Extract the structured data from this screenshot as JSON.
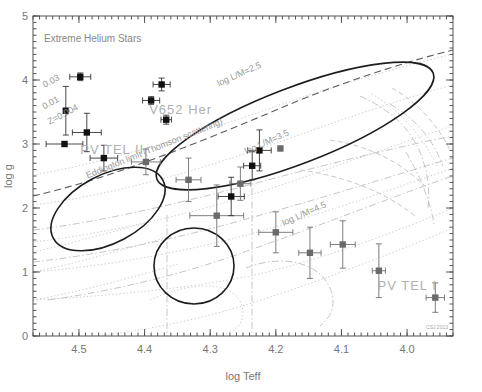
{
  "figure": {
    "title": "Extreme Helium Stars",
    "credit": "CSJ 2013"
  },
  "axes": {
    "x": {
      "label": "log Teff",
      "ticks": [
        "4.5",
        "4.4",
        "4.3",
        "4.2",
        "4.1",
        "4.0"
      ],
      "tick_values": [
        4.5,
        4.4,
        4.3,
        4.2,
        4.1,
        4.0
      ],
      "range": [
        4.57,
        3.93
      ],
      "minor_per_major": 10
    },
    "y": {
      "label": "log g",
      "ticks": [
        "0",
        "1",
        "2",
        "3",
        "4",
        "5"
      ],
      "tick_values": [
        0,
        1,
        2,
        3,
        4,
        5
      ],
      "range": [
        0,
        5
      ],
      "inverted": true,
      "minor_per_major": 10
    }
  },
  "annotations": [
    {
      "name": "eddington-limit-label",
      "text": "Eddington limit (Thomson scattering)",
      "x": 4.487,
      "y": 2.46,
      "rotation": -22,
      "style": "annot"
    },
    {
      "name": "pv-tel-i-label",
      "text": "PV TEL I",
      "x": 4.045,
      "y": 0.72,
      "rotation": 0,
      "style": "annot-big"
    },
    {
      "name": "pv-tel-ii-label",
      "text": "PV TEL II",
      "x": 4.498,
      "y": 2.85,
      "rotation": 0,
      "style": "annot-big"
    },
    {
      "name": "v652-her-label",
      "text": "V652 Her",
      "x": 4.393,
      "y": 3.47,
      "rotation": 0,
      "style": "annot-big"
    },
    {
      "name": "log-lm-45-label",
      "text": "log L/M=4.5",
      "x": 4.188,
      "y": 1.72,
      "rotation": -24,
      "style": "annot"
    },
    {
      "name": "log-lm-35-label",
      "text": "log L/M=3.5",
      "x": 4.245,
      "y": 2.84,
      "rotation": -24,
      "style": "annot"
    },
    {
      "name": "log-lm-25-label",
      "text": "log L/M=2.5",
      "x": 4.287,
      "y": 3.9,
      "rotation": -24,
      "style": "annot"
    },
    {
      "name": "metallicity-z0004-label",
      "text": "Z=0.004",
      "x": 4.545,
      "y": 3.3,
      "rotation": -28,
      "style": "annot"
    },
    {
      "name": "metallicity-001-label",
      "text": "0.01",
      "x": 4.553,
      "y": 3.54,
      "rotation": -28,
      "style": "annot"
    },
    {
      "name": "metallicity-003-label",
      "text": "0.03",
      "x": 4.552,
      "y": 3.88,
      "rotation": -28,
      "style": "annot"
    }
  ],
  "chart_data": {
    "type": "scatter",
    "title": "Extreme Helium Stars",
    "xlabel": "log Teff",
    "ylabel": "log g",
    "xlim": [
      4.57,
      3.93
    ],
    "ylim": [
      5,
      0
    ],
    "x_inverted": true,
    "y_inverted": true,
    "grid": false,
    "legend": "none",
    "points": [
      {
        "x": 4.488,
        "y": 3.18,
        "xerr": 0.022,
        "yerr": 0.3,
        "marker": "square",
        "shade": "dark"
      },
      {
        "x": 4.462,
        "y": 2.78,
        "xerr": 0.021,
        "yerr": 0.2,
        "marker": "square",
        "shade": "dark"
      },
      {
        "x": 4.522,
        "y": 3.0,
        "xerr": 0.028,
        "yerr": 0.0,
        "marker": "square",
        "shade": "dark"
      },
      {
        "x": 4.52,
        "y": 3.52,
        "xerr": 0.0,
        "yerr": 0.38,
        "marker": "square",
        "shade": "dark"
      },
      {
        "x": 4.498,
        "y": 4.05,
        "xerr": 0.016,
        "yerr": 0.06,
        "marker": "square",
        "shade": "dark"
      },
      {
        "x": 4.367,
        "y": 3.38,
        "xerr": 0.008,
        "yerr": 0.07,
        "marker": "square",
        "shade": "dark"
      },
      {
        "x": 4.39,
        "y": 3.68,
        "xerr": 0.013,
        "yerr": 0.06,
        "marker": "square",
        "shade": "dark"
      },
      {
        "x": 4.374,
        "y": 3.93,
        "xerr": 0.013,
        "yerr": 0.1,
        "marker": "square",
        "shade": "dark"
      },
      {
        "x": 4.398,
        "y": 2.72,
        "xerr": 0.022,
        "yerr": 0.2,
        "marker": "square",
        "shade": "mid"
      },
      {
        "x": 4.333,
        "y": 2.44,
        "xerr": 0.019,
        "yerr": 0.34,
        "marker": "square",
        "shade": "mid"
      },
      {
        "x": 4.29,
        "y": 1.88,
        "xerr": 0.041,
        "yerr": 0.48,
        "marker": "square",
        "shade": "mid"
      },
      {
        "x": 4.268,
        "y": 2.18,
        "xerr": 0.02,
        "yerr": 0.3,
        "marker": "square",
        "shade": "dark"
      },
      {
        "x": 4.254,
        "y": 2.38,
        "xerr": 0.016,
        "yerr": 0.26,
        "marker": "square",
        "shade": "mid"
      },
      {
        "x": 4.236,
        "y": 2.66,
        "xerr": 0.013,
        "yerr": 0.22,
        "marker": "square",
        "shade": "dark"
      },
      {
        "x": 4.225,
        "y": 2.9,
        "xerr": 0.018,
        "yerr": 0.32,
        "marker": "square",
        "shade": "dark"
      },
      {
        "x": 4.2,
        "y": 1.62,
        "xerr": 0.026,
        "yerr": 0.32,
        "marker": "square",
        "shade": "mid"
      },
      {
        "x": 4.193,
        "y": 2.93,
        "xerr": 0.0,
        "yerr": 0.0,
        "marker": "square",
        "shade": "mid"
      },
      {
        "x": 4.148,
        "y": 1.3,
        "xerr": 0.017,
        "yerr": 0.4,
        "marker": "square",
        "shade": "mid"
      },
      {
        "x": 4.098,
        "y": 1.43,
        "xerr": 0.019,
        "yerr": 0.37,
        "marker": "square",
        "shade": "mid"
      },
      {
        "x": 4.043,
        "y": 1.02,
        "xerr": 0.01,
        "yerr": 0.42,
        "marker": "square",
        "shade": "mid"
      },
      {
        "x": 3.957,
        "y": 0.6,
        "xerr": 0.014,
        "yerr": 0.23,
        "marker": "square",
        "shade": "mid"
      }
    ],
    "group_ellipses": [
      {
        "name": "PV TEL I",
        "cx": 4.225,
        "cy": 1.72,
        "rx": 0.178,
        "ry": 0.56,
        "angle": -23
      },
      {
        "name": "PV TEL II",
        "cx": 4.492,
        "cy": 3.02,
        "rx": 0.072,
        "ry": 0.48,
        "angle": -38
      },
      {
        "name": "V652 Her",
        "cx": 4.377,
        "cy": 3.68,
        "rx": 0.044,
        "ry": 0.53,
        "angle": 0
      }
    ],
    "curves": [
      {
        "name": "eddington-limit",
        "style": "dashed-dark"
      },
      {
        "name": "evolution-tracks",
        "style": "dotted-light"
      },
      {
        "name": "metallicity-tracks",
        "style": "dash-dot-light"
      }
    ]
  }
}
